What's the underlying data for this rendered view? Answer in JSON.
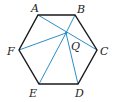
{
  "diagram": {
    "type": "geometry",
    "shape": "regular hexagon",
    "colors": {
      "outline": "#1a1a1a",
      "lines": "#2a8fc7",
      "text": "#222222"
    },
    "vertices": [
      {
        "name": "A",
        "x": 38,
        "y": 15,
        "lx": 31,
        "ly": 12
      },
      {
        "name": "B",
        "x": 75,
        "y": 15,
        "lx": 77,
        "ly": 13
      },
      {
        "name": "C",
        "x": 97,
        "y": 50,
        "lx": 100,
        "ly": 55
      },
      {
        "name": "D",
        "x": 78,
        "y": 84,
        "lx": 75,
        "ly": 97
      },
      {
        "name": "E",
        "x": 39,
        "y": 84,
        "lx": 29,
        "ly": 97
      },
      {
        "name": "F",
        "x": 19,
        "y": 50,
        "lx": 7,
        "ly": 55
      }
    ],
    "point": {
      "name": "Q",
      "x": 66,
      "y": 33,
      "lx": 71,
      "ly": 50
    },
    "segments": [
      {
        "from": "A",
        "to": "C"
      },
      {
        "from": "Q",
        "to": "F"
      },
      {
        "from": "Q",
        "to": "E"
      },
      {
        "from": "Q",
        "to": "D"
      },
      {
        "from": "Q",
        "to": "B"
      }
    ]
  }
}
